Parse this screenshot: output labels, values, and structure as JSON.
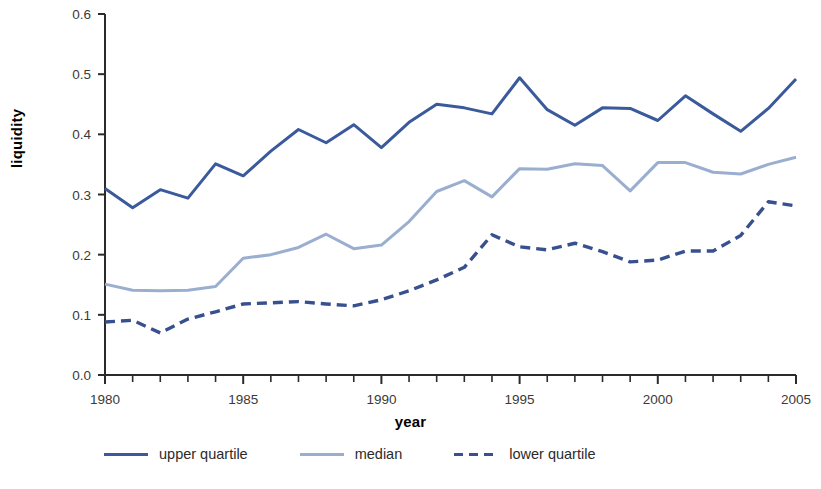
{
  "chart_data": {
    "type": "line",
    "title": "",
    "xlabel": "year",
    "ylabel": "liquidity",
    "xlim": [
      1980,
      2005
    ],
    "ylim": [
      0.0,
      0.6
    ],
    "grid": false,
    "legend_position": "bottom-left",
    "xticks": [
      1980,
      1985,
      1990,
      1995,
      2000,
      2005
    ],
    "xtick_labels": [
      "1980",
      "1985",
      "1990",
      "1995",
      "2000",
      "2005"
    ],
    "xminor_tick_interval": 1,
    "yticks": [
      0.0,
      0.1,
      0.2,
      0.3,
      0.4,
      0.5,
      0.6
    ],
    "ytick_labels": [
      "0.0",
      "0.1",
      "0.2",
      "0.3",
      "0.4",
      "0.5",
      "0.6"
    ],
    "x": [
      1980,
      1981,
      1982,
      1983,
      1984,
      1985,
      1986,
      1987,
      1988,
      1989,
      1990,
      1991,
      1992,
      1993,
      1994,
      1995,
      1996,
      1997,
      1998,
      1999,
      2000,
      2001,
      2002,
      2003,
      2004,
      2005
    ],
    "series": [
      {
        "name": "upper quartile",
        "color": "#3a5a9b",
        "style": "solid",
        "values": [
          0.31,
          0.278,
          0.308,
          0.294,
          0.351,
          0.331,
          0.372,
          0.408,
          0.386,
          0.416,
          0.378,
          0.42,
          0.45,
          0.444,
          0.434,
          0.494,
          0.441,
          0.415,
          0.444,
          0.443,
          0.423,
          0.464,
          0.434,
          0.405,
          0.443,
          0.492
        ]
      },
      {
        "name": "median",
        "color": "#9aaed0",
        "style": "solid",
        "values": [
          0.151,
          0.141,
          0.14,
          0.141,
          0.147,
          0.194,
          0.2,
          0.212,
          0.234,
          0.21,
          0.216,
          0.255,
          0.305,
          0.323,
          0.296,
          0.343,
          0.342,
          0.351,
          0.348,
          0.306,
          0.353,
          0.353,
          0.337,
          0.334,
          0.35,
          0.362
        ]
      },
      {
        "name": "lower quartile",
        "color": "#38508f",
        "style": "dashed",
        "values": [
          0.088,
          0.091,
          0.07,
          0.093,
          0.105,
          0.118,
          0.12,
          0.122,
          0.118,
          0.115,
          0.125,
          0.14,
          0.158,
          0.179,
          0.233,
          0.213,
          0.208,
          0.219,
          0.205,
          0.188,
          0.191,
          0.206,
          0.206,
          0.232,
          0.288,
          0.281
        ]
      }
    ]
  },
  "legend": {
    "items": [
      {
        "label": "upper quartile"
      },
      {
        "label": "median"
      },
      {
        "label": "lower quartile"
      }
    ]
  }
}
